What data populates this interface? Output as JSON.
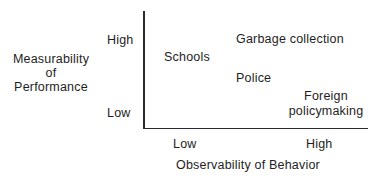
{
  "diagram": {
    "type": "2x2 conceptual plot",
    "y_axis": {
      "title_lines": [
        "Measurability",
        "of",
        "Performance"
      ],
      "high_label": "High",
      "low_label": "Low"
    },
    "x_axis": {
      "title": "Observability of Behavior",
      "low_label": "Low",
      "high_label": "High"
    },
    "items": [
      {
        "label": "Garbage collection",
        "observability": "high",
        "measurability": "high"
      },
      {
        "label": "Schools",
        "observability": "low",
        "measurability": "high"
      },
      {
        "label": "Police",
        "observability": "high",
        "measurability": "medium"
      },
      {
        "label_lines": [
          "Foreign",
          "policymaking"
        ],
        "observability": "high",
        "measurability": "low"
      }
    ],
    "colors": {
      "text": "#1e1e1e",
      "axis": "#2a2a2a",
      "background": "#ffffff"
    }
  }
}
